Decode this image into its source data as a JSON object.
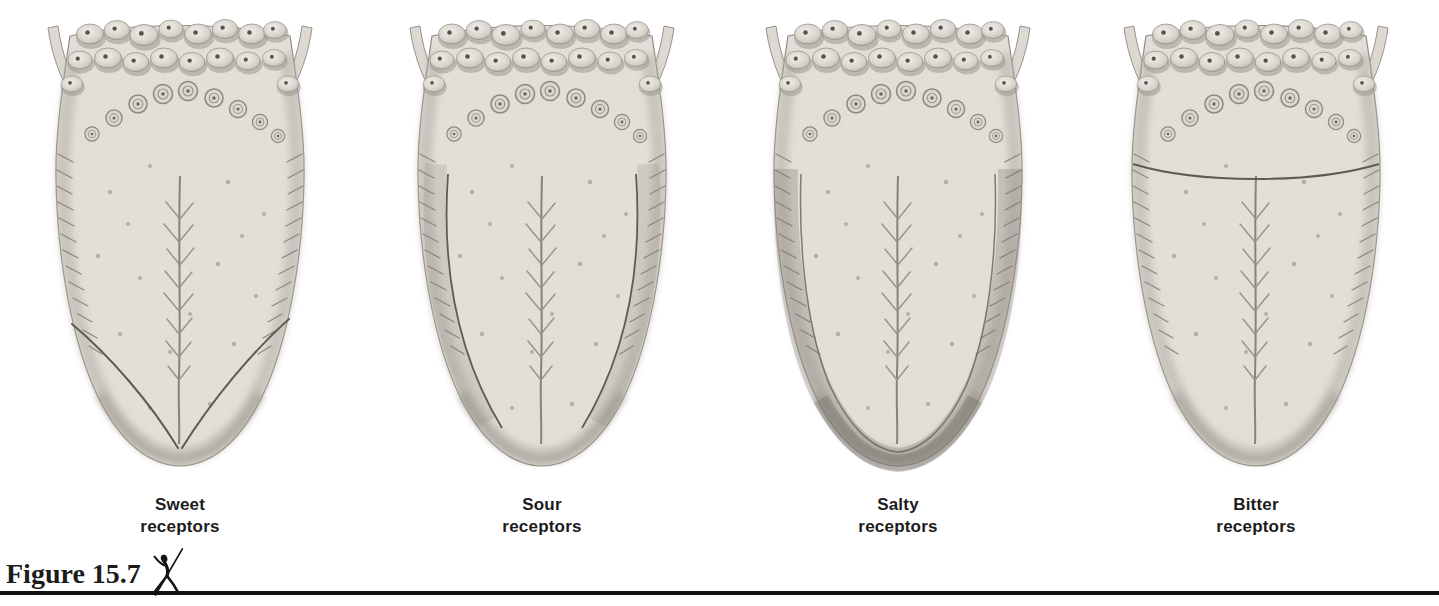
{
  "figure_caption": {
    "label": "Figure 15.7",
    "icon": "leaping-dancer-icon"
  },
  "panels": [
    {
      "id": "sweet",
      "label_line1": "Sweet",
      "label_line2": "receptors",
      "highlighted_region": "tongue tip (V-shaped outline near tip)"
    },
    {
      "id": "sour",
      "label_line1": "Sour",
      "label_line2": "receptors",
      "highlighted_region": "lateral margins (outlined strips on both sides)"
    },
    {
      "id": "salty",
      "label_line1": "Salty",
      "label_line2": "receptors",
      "highlighted_region": "tip and lateral margins (dark rim band)"
    },
    {
      "id": "bitter",
      "label_line1": "Bitter",
      "label_line2": "receptors",
      "highlighted_region": "back of tongue (arc line across rear)"
    }
  ],
  "colors": {
    "ink": "#1c1c1c",
    "rule": "#121212",
    "paper": "#ffffff",
    "tongue_body": "#e6e2dc",
    "tongue_line": "#7a756c"
  }
}
